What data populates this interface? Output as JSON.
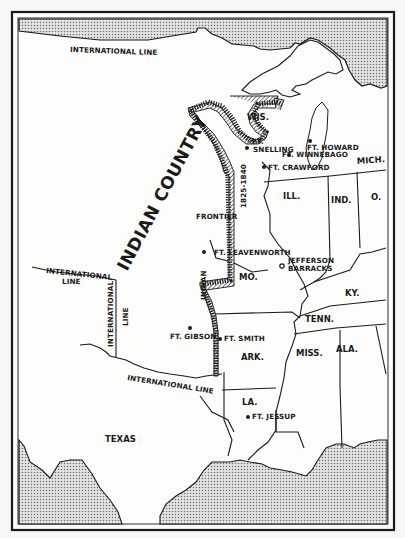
{
  "map": {
    "title": "Indian Frontier 1825-1840",
    "colors": {
      "background": "#f7f7f5",
      "ink": "#1a1a1a",
      "water_fill": "#c9c9c9"
    },
    "regions": {
      "indian_country": "INDIAN COUNTRY",
      "texas": "TEXAS",
      "wis": "WIS.",
      "mich": "MICH.",
      "ill": "ILL.",
      "ind": "IND.",
      "ohio": "O.",
      "mo": "MO.",
      "ky": "KY.",
      "tenn": "TENN.",
      "ark": "ARK.",
      "miss": "MISS.",
      "ala": "ALA.",
      "la": "LA."
    },
    "boundaries": {
      "intl_top": "INTERNATIONAL LINE",
      "intl_west_1": "INTERNATIONAL",
      "intl_west_2": "LINE",
      "intl_vert_1": "INTERNATIONAL",
      "intl_vert_2": "LINE",
      "intl_south": "INTERNATIONAL LINE",
      "frontier": "FRONTIER",
      "frontier_years": "1825-1840",
      "indian": "INDIAN"
    },
    "forts": [
      {
        "name_1": "FT.",
        "name_2": "SNELLING"
      },
      {
        "name": "FT. HOWARD"
      },
      {
        "name": "FT. WINNEBAGO"
      },
      {
        "name": "FT. CRAWFORD"
      },
      {
        "name": "FT. LEAVENWORTH"
      },
      {
        "name_1": "JEFFERSON",
        "name_2": "BARRACKS"
      },
      {
        "name": "FT. GIBSON"
      },
      {
        "name": "FT. SMITH"
      },
      {
        "name": "FT. JESSUP"
      }
    ]
  }
}
